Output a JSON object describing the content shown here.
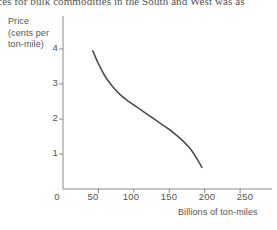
{
  "page": {
    "truncated_caption": "ices for bulk commodities in the South and West was as"
  },
  "chart_data": {
    "type": "line",
    "title": "",
    "xlabel": "Billions of ton-miles",
    "ylabel": "Price (cents per ton-mile)",
    "ylabel_lines": [
      "Price",
      "(cents per",
      "ton-mile)"
    ],
    "xlim": [
      0,
      295
    ],
    "ylim": [
      0,
      4.35
    ],
    "grid": false,
    "legend": "none",
    "xticks": [
      0,
      50,
      100,
      150,
      200,
      250
    ],
    "xtick_labels": [
      "0",
      "50",
      "100",
      "150",
      "200",
      "250"
    ],
    "yticks": [
      1,
      2,
      3,
      4
    ],
    "ytick_labels": [
      "1",
      "2",
      "3",
      "4"
    ],
    "series": [
      {
        "name": "demand curve",
        "color": "#4f4f4f",
        "x": [
          42,
          50,
          60,
          70,
          80,
          90,
          100,
          110,
          120,
          130,
          140,
          150,
          160,
          170,
          180,
          190,
          196
        ],
        "y": [
          3.95,
          3.58,
          3.2,
          2.93,
          2.71,
          2.54,
          2.4,
          2.26,
          2.12,
          1.98,
          1.84,
          1.7,
          1.54,
          1.36,
          1.14,
          0.83,
          0.62
        ]
      }
    ],
    "axis_color": "#8a8a8a",
    "curve_color": "#4f4f4f"
  }
}
